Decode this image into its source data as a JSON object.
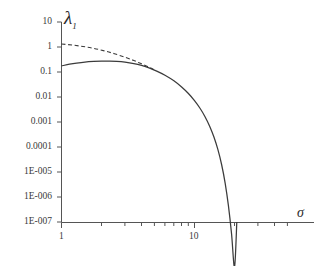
{
  "chart_data": {
    "type": "line",
    "title": "",
    "xlabel": "σ",
    "ylabel": "λ",
    "ylabel_sub": "1",
    "xscale": "log",
    "yscale": "log",
    "xlim": [
      1,
      22
    ],
    "ylim": [
      1e-07,
      10
    ],
    "grid": false,
    "legend": "none",
    "x_tick_labels": [
      "1",
      "10"
    ],
    "x_tick_values": [
      1,
      10
    ],
    "y_tick_labels": [
      "10",
      "1",
      "0.1",
      "0.01",
      "0.001",
      "0.0001",
      "1E-005",
      "1E-006",
      "1E-007"
    ],
    "y_tick_values": [
      10,
      1,
      0.1,
      0.01,
      0.001,
      0.0001,
      1e-05,
      1e-06,
      1e-07
    ],
    "series": [
      {
        "name": "solid",
        "style": "solid",
        "color": "#3b3b3b",
        "x": [
          1.0,
          1.15,
          1.3,
          1.5,
          1.75,
          2.0,
          2.3,
          2.6,
          3.0,
          3.5,
          4.0,
          4.6,
          5.2,
          6.0,
          7.0,
          8.0,
          9.0,
          10.0,
          11.0,
          12.0,
          13.0,
          14.0,
          15.0,
          16.0,
          17.0,
          18.0,
          19.0,
          20.0,
          20.8
        ],
        "y": [
          0.175,
          0.205,
          0.228,
          0.25,
          0.264,
          0.272,
          0.274,
          0.268,
          0.25,
          0.218,
          0.183,
          0.143,
          0.109,
          0.0745,
          0.0445,
          0.0252,
          0.0138,
          0.0072,
          0.00355,
          0.00163,
          0.00068,
          0.00025,
          7.8e-05,
          1.95e-05,
          3.6e-06,
          4.4e-07,
          3.3e-08,
          1.6e-09,
          1e-07
        ]
      },
      {
        "name": "dashed",
        "style": "dashed",
        "color": "#3b3b3b",
        "x": [
          1.0,
          1.2,
          1.45,
          1.75,
          2.1,
          2.5,
          3.0,
          3.5,
          4.0,
          4.6,
          5.0
        ],
        "y": [
          1.32,
          1.2,
          1.05,
          0.88,
          0.7,
          0.54,
          0.39,
          0.287,
          0.212,
          0.152,
          0.122
        ]
      }
    ],
    "annotations": []
  },
  "axis": {
    "color": "#555555"
  }
}
